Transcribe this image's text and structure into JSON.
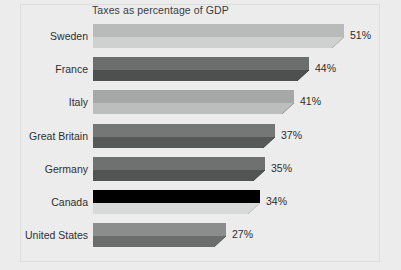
{
  "chart_data": {
    "type": "bar",
    "orientation": "horizontal",
    "title": "Taxes as percentage of GDP",
    "xlabel": "",
    "ylabel": "",
    "xlim": [
      0,
      58
    ],
    "grid": false,
    "legend": null,
    "value_suffix": "%",
    "categories": [
      "Sweden",
      "France",
      "Italy",
      "Great Britain",
      "Germany",
      "Canada",
      "United States"
    ],
    "values": [
      51,
      44,
      41,
      37,
      35,
      34,
      27
    ],
    "data_labels": [
      "51%",
      "44%",
      "41%",
      "37%",
      "35%",
      "34%",
      "27%"
    ],
    "bars": [
      {
        "category": "Sweden",
        "value": 51,
        "label": "51%",
        "top_color": "#b9bbbb",
        "front_color": "#cfd1d1",
        "edge_color": "#a9abab"
      },
      {
        "category": "France",
        "value": 44,
        "label": "44%",
        "top_color": "#6c6e6e",
        "front_color": "#4e5050",
        "edge_color": "#3b3d3d"
      },
      {
        "category": "Italy",
        "value": 41,
        "label": "41%",
        "top_color": "#a6a8a8",
        "front_color": "#bcbebe",
        "edge_color": "#949696"
      },
      {
        "category": "Great Britain",
        "value": 37,
        "label": "37%",
        "top_color": "#757777",
        "front_color": "#575959",
        "edge_color": "#434545"
      },
      {
        "category": "Germany",
        "value": 35,
        "label": "35%",
        "top_color": "#6f7171",
        "front_color": "#525454",
        "edge_color": "#3f4141"
      },
      {
        "category": "Canada",
        "value": 34,
        "label": "34%",
        "top_color": "#c8cacа",
        "front_color": "#d8dada",
        "edge_color": "#bcbebe"
      },
      {
        "category": "United States",
        "value": 27,
        "label": "27%",
        "top_color": "#8b8d8d",
        "front_color": "#6b6d6d",
        "edge_color": "#5a5c5c"
      }
    ],
    "colors": {
      "background": "#ececed",
      "title_text": "#3b3b3b",
      "category_text": "#2f2f2f",
      "value_text": "#2d2d2d",
      "frame": "#dcdcdc"
    }
  }
}
